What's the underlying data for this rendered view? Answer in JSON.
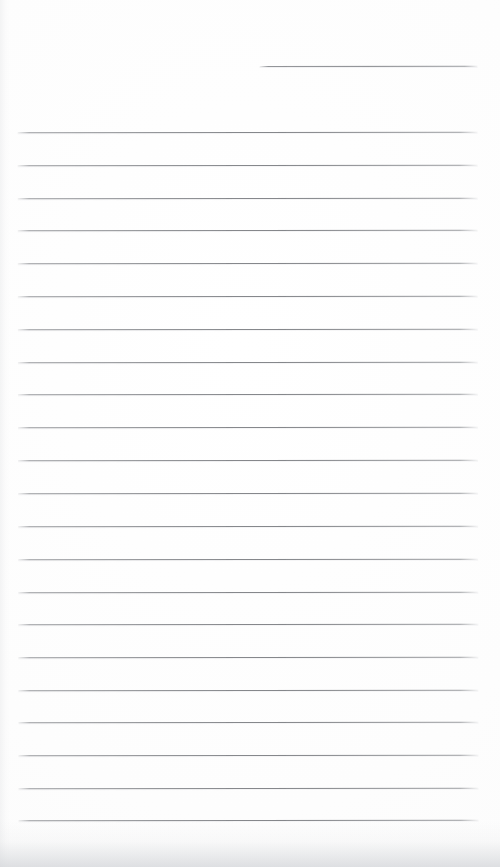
{
  "page": {
    "kind": "scanned-lined-notepad-page",
    "width": 500,
    "height": 867,
    "background_color": "#fdfdfd",
    "rule_color": "#888a8e",
    "shadow_color": "#d3d5d9",
    "title": "",
    "body_text": "",
    "notes_count": 0
  },
  "header_rule": {
    "name": "date-line",
    "label": "",
    "x": 260,
    "y": 66,
    "width": 218
  },
  "ruled_lines": [
    {
      "index": 1,
      "y": 132,
      "x": 18,
      "width": 460
    },
    {
      "index": 2,
      "y": 165,
      "x": 18,
      "width": 460
    },
    {
      "index": 3,
      "y": 198,
      "x": 18,
      "width": 460
    },
    {
      "index": 4,
      "y": 230,
      "x": 18,
      "width": 460
    },
    {
      "index": 5,
      "y": 263,
      "x": 18,
      "width": 460
    },
    {
      "index": 6,
      "y": 296,
      "x": 18,
      "width": 460
    },
    {
      "index": 7,
      "y": 329,
      "x": 18,
      "width": 460
    },
    {
      "index": 8,
      "y": 362,
      "x": 18,
      "width": 460
    },
    {
      "index": 9,
      "y": 394,
      "x": 18,
      "width": 460
    },
    {
      "index": 10,
      "y": 427,
      "x": 18,
      "width": 460
    },
    {
      "index": 11,
      "y": 460,
      "x": 18,
      "width": 460
    },
    {
      "index": 12,
      "y": 493,
      "x": 18,
      "width": 460
    },
    {
      "index": 13,
      "y": 526,
      "x": 18,
      "width": 460
    },
    {
      "index": 14,
      "y": 559,
      "x": 18,
      "width": 460
    },
    {
      "index": 15,
      "y": 592,
      "x": 18,
      "width": 460
    },
    {
      "index": 16,
      "y": 624,
      "x": 18,
      "width": 460
    },
    {
      "index": 17,
      "y": 657,
      "x": 18,
      "width": 460
    },
    {
      "index": 18,
      "y": 690,
      "x": 18,
      "width": 460
    },
    {
      "index": 19,
      "y": 722,
      "x": 18,
      "width": 460
    },
    {
      "index": 20,
      "y": 755,
      "x": 18,
      "width": 460
    },
    {
      "index": 21,
      "y": 788,
      "x": 18,
      "width": 460
    },
    {
      "index": 22,
      "y": 820,
      "x": 18,
      "width": 460
    }
  ]
}
